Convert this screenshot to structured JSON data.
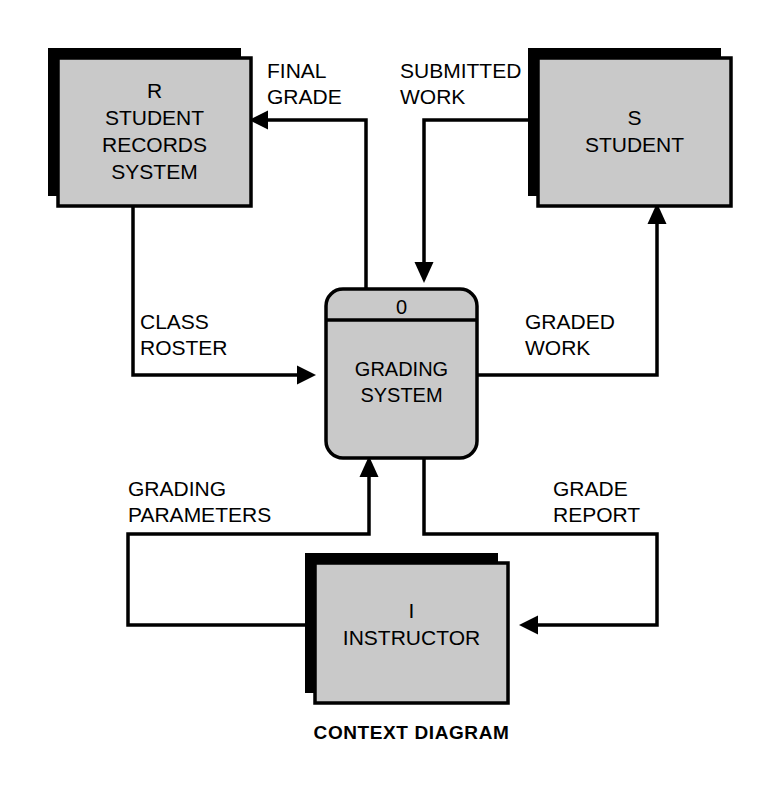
{
  "diagram": {
    "caption": "CONTEXT DIAGRAM",
    "colors": {
      "fill": "#c9c9c9",
      "shadow": "#000000",
      "stroke": "#000000",
      "background": "#ffffff"
    },
    "process": {
      "number": "0",
      "name_line1": "GRADING",
      "name_line2": "SYSTEM"
    },
    "entities": [
      {
        "id": "student-records-system",
        "code": "R",
        "name_line1": "STUDENT",
        "name_line2": "RECORDS",
        "name_line3": "SYSTEM"
      },
      {
        "id": "student",
        "code": "S",
        "name_line1": "STUDENT",
        "name_line2": "",
        "name_line3": ""
      },
      {
        "id": "instructor",
        "code": "I",
        "name_line1": "INSTRUCTOR",
        "name_line2": "",
        "name_line3": ""
      }
    ],
    "flows": [
      {
        "id": "final-grade",
        "line1": "FINAL",
        "line2": "GRADE",
        "from": "grading-system",
        "to": "student-records-system"
      },
      {
        "id": "submitted-work",
        "line1": "SUBMITTED",
        "line2": "WORK",
        "from": "student",
        "to": "grading-system"
      },
      {
        "id": "class-roster",
        "line1": "CLASS",
        "line2": "ROSTER",
        "from": "student-records-system",
        "to": "grading-system"
      },
      {
        "id": "graded-work",
        "line1": "GRADED",
        "line2": "WORK",
        "from": "grading-system",
        "to": "student"
      },
      {
        "id": "grading-parameters",
        "line1": "GRADING",
        "line2": "PARAMETERS",
        "from": "instructor",
        "to": "grading-system"
      },
      {
        "id": "grade-report",
        "line1": "GRADE",
        "line2": "REPORT",
        "from": "grading-system",
        "to": "instructor"
      }
    ]
  }
}
